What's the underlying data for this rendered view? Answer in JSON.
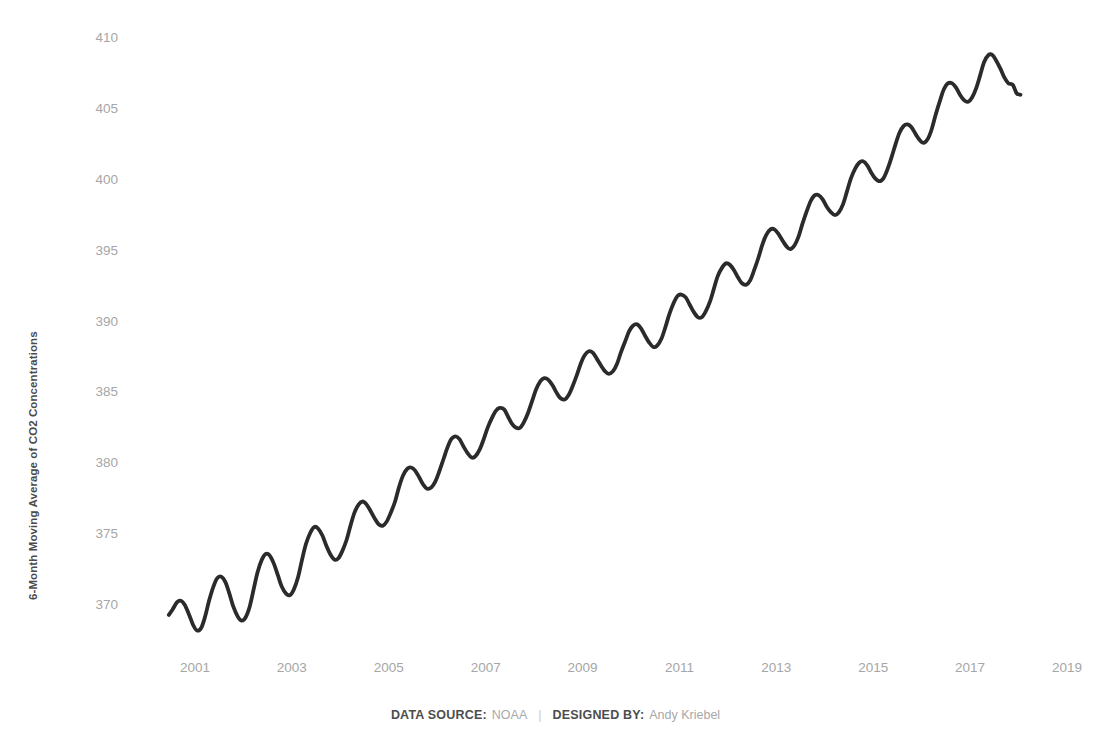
{
  "axes": {
    "y_title": "6-Month Moving Average of CO2 Concentrations",
    "y_ticks": [
      "370",
      "375",
      "380",
      "385",
      "390",
      "395",
      "400",
      "405",
      "410"
    ],
    "x_ticks": [
      "2001",
      "2003",
      "2005",
      "2007",
      "2009",
      "2011",
      "2013",
      "2015",
      "2017",
      "2019"
    ]
  },
  "footer": {
    "source_label": "DATA SOURCE:",
    "source_value": "NOAA",
    "separator": "|",
    "designer_label": "DESIGNED BY:",
    "designer_value": "Andy Kriebel"
  },
  "style": {
    "line_color": "#2b2b2b",
    "tick_color": "#a6a6a6",
    "title_color": "#4b4b4b",
    "background": "#ffffff",
    "line_width": 3.8
  },
  "chart_data": {
    "type": "line",
    "title": "",
    "xlabel": "",
    "ylabel": "6-Month Moving Average of CO2 Concentrations",
    "xlim": [
      2000.4,
      2019.0
    ],
    "ylim": [
      367.4,
      410.6
    ],
    "grid": false,
    "legend": null,
    "y_ticks": [
      370,
      375,
      380,
      385,
      390,
      395,
      400,
      405,
      410
    ],
    "x_ticks": [
      2001,
      2003,
      2005,
      2007,
      2009,
      2011,
      2013,
      2015,
      2017,
      2019
    ],
    "series": [
      {
        "name": "6-Month Moving Average of CO2 Concentrations",
        "color": "#2b2b2b",
        "x": [
          2000.46,
          2000.54,
          2000.63,
          2000.71,
          2000.79,
          2000.88,
          2000.96,
          2001.04,
          2001.13,
          2001.21,
          2001.29,
          2001.38,
          2001.46,
          2001.54,
          2001.63,
          2001.71,
          2001.79,
          2001.88,
          2001.96,
          2002.04,
          2002.13,
          2002.21,
          2002.29,
          2002.38,
          2002.46,
          2002.54,
          2002.63,
          2002.71,
          2002.79,
          2002.88,
          2002.96,
          2003.04,
          2003.13,
          2003.21,
          2003.29,
          2003.38,
          2003.46,
          2003.54,
          2003.63,
          2003.71,
          2003.79,
          2003.88,
          2003.96,
          2004.04,
          2004.13,
          2004.21,
          2004.29,
          2004.38,
          2004.46,
          2004.54,
          2004.63,
          2004.71,
          2004.79,
          2004.88,
          2004.96,
          2005.04,
          2005.13,
          2005.21,
          2005.29,
          2005.38,
          2005.46,
          2005.54,
          2005.63,
          2005.71,
          2005.79,
          2005.88,
          2005.96,
          2006.04,
          2006.13,
          2006.21,
          2006.29,
          2006.38,
          2006.46,
          2006.54,
          2006.63,
          2006.71,
          2006.79,
          2006.88,
          2006.96,
          2007.04,
          2007.13,
          2007.21,
          2007.29,
          2007.38,
          2007.46,
          2007.54,
          2007.63,
          2007.71,
          2007.79,
          2007.88,
          2007.96,
          2008.04,
          2008.13,
          2008.21,
          2008.29,
          2008.38,
          2008.46,
          2008.54,
          2008.63,
          2008.71,
          2008.79,
          2008.88,
          2008.96,
          2009.04,
          2009.13,
          2009.21,
          2009.29,
          2009.38,
          2009.46,
          2009.54,
          2009.63,
          2009.71,
          2009.79,
          2009.88,
          2009.96,
          2010.04,
          2010.13,
          2010.21,
          2010.29,
          2010.38,
          2010.46,
          2010.54,
          2010.63,
          2010.71,
          2010.79,
          2010.88,
          2010.96,
          2011.04,
          2011.13,
          2011.21,
          2011.29,
          2011.38,
          2011.46,
          2011.54,
          2011.63,
          2011.71,
          2011.79,
          2011.88,
          2011.96,
          2012.04,
          2012.13,
          2012.21,
          2012.29,
          2012.38,
          2012.46,
          2012.54,
          2012.63,
          2012.71,
          2012.79,
          2012.88,
          2012.96,
          2013.04,
          2013.13,
          2013.21,
          2013.29,
          2013.38,
          2013.46,
          2013.54,
          2013.63,
          2013.71,
          2013.79,
          2013.88,
          2013.96,
          2014.04,
          2014.13,
          2014.21,
          2014.29,
          2014.38,
          2014.46,
          2014.54,
          2014.63,
          2014.71,
          2014.79,
          2014.88,
          2014.96,
          2015.04,
          2015.13,
          2015.21,
          2015.29,
          2015.38,
          2015.46,
          2015.54,
          2015.63,
          2015.71,
          2015.79,
          2015.88,
          2015.96,
          2016.04,
          2016.13,
          2016.21,
          2016.29,
          2016.38,
          2016.46,
          2016.54,
          2016.63,
          2016.71,
          2016.79,
          2016.88,
          2016.96,
          2017.04,
          2017.13,
          2017.21,
          2017.29,
          2017.38,
          2017.46,
          2017.54,
          2017.63,
          2017.71,
          2017.79,
          2017.88,
          2017.96,
          2018.04
        ],
        "y": [
          369.3,
          369.7,
          370.2,
          370.3,
          370.0,
          369.3,
          368.6,
          368.2,
          368.4,
          369.2,
          370.3,
          371.3,
          371.9,
          372.0,
          371.6,
          370.8,
          369.9,
          369.2,
          368.9,
          369.1,
          369.9,
          371.1,
          372.3,
          373.2,
          373.6,
          373.5,
          372.9,
          372.1,
          371.3,
          370.8,
          370.7,
          371.1,
          372.0,
          373.2,
          374.3,
          375.1,
          375.5,
          375.4,
          374.9,
          374.2,
          373.6,
          373.2,
          373.3,
          373.8,
          374.6,
          375.6,
          376.5,
          377.1,
          377.3,
          377.1,
          376.6,
          376.1,
          375.7,
          375.6,
          375.9,
          376.5,
          377.3,
          378.3,
          379.1,
          379.6,
          379.7,
          379.5,
          379.0,
          378.5,
          378.2,
          378.3,
          378.7,
          379.4,
          380.3,
          381.1,
          381.7,
          381.9,
          381.7,
          381.2,
          380.7,
          380.4,
          380.5,
          381.0,
          381.7,
          382.5,
          383.2,
          383.7,
          383.9,
          383.8,
          383.3,
          382.8,
          382.5,
          382.5,
          382.9,
          383.6,
          384.4,
          385.2,
          385.8,
          386.0,
          385.9,
          385.5,
          385.0,
          384.6,
          384.5,
          384.8,
          385.4,
          386.2,
          387.0,
          387.6,
          387.9,
          387.8,
          387.4,
          386.9,
          386.5,
          386.3,
          386.5,
          387.0,
          387.8,
          388.6,
          389.3,
          389.7,
          389.8,
          389.5,
          389.0,
          388.5,
          388.2,
          388.3,
          388.8,
          389.6,
          390.5,
          391.3,
          391.8,
          391.9,
          391.7,
          391.2,
          390.7,
          390.3,
          390.3,
          390.7,
          391.4,
          392.3,
          393.2,
          393.8,
          394.1,
          394.0,
          393.6,
          393.1,
          392.7,
          392.6,
          392.9,
          393.6,
          394.5,
          395.4,
          396.1,
          396.5,
          396.5,
          396.2,
          395.7,
          395.3,
          395.1,
          395.4,
          396.0,
          396.9,
          397.8,
          398.5,
          398.9,
          398.9,
          398.6,
          398.1,
          397.7,
          397.5,
          397.7,
          398.3,
          399.2,
          400.1,
          400.8,
          401.2,
          401.3,
          401.0,
          400.5,
          400.1,
          399.9,
          400.1,
          400.7,
          401.6,
          402.5,
          403.3,
          403.8,
          403.9,
          403.7,
          403.2,
          402.8,
          402.6,
          402.9,
          403.6,
          404.6,
          405.6,
          406.4,
          406.8,
          406.8,
          406.5,
          406.0,
          405.6,
          405.5,
          405.8,
          406.5,
          407.4,
          408.3,
          408.8,
          408.8,
          408.4,
          407.8,
          407.2,
          406.8,
          406.7,
          406.1,
          406.0
        ]
      }
    ]
  }
}
